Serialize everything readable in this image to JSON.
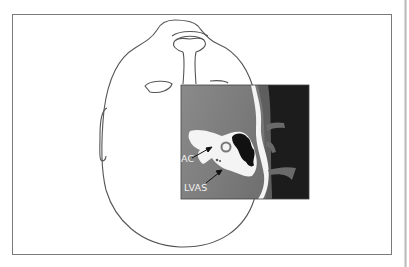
{
  "figure": {
    "labels": {
      "ac": "AC",
      "lvas": "LVAS"
    },
    "colors": {
      "frame_border": "#7a7a7a",
      "outline": "#555555",
      "ct_gray_light": "#9a9a9a",
      "ct_gray_dark": "#6e6e6e",
      "ct_background_dark": "#1c1c1c",
      "bone_white": "#f4f4f4"
    }
  }
}
